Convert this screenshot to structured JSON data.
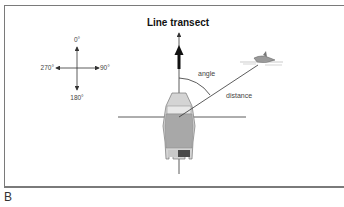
{
  "diagram": {
    "title": "Line transect",
    "panel_label": "B",
    "compass": {
      "north": "0°",
      "east": "90°",
      "south": "180°",
      "west": "270°"
    },
    "labels": {
      "angle": "angle",
      "distance": "distance"
    },
    "icons": {
      "vessel": "boat-icon",
      "target": "dolphin-icon",
      "heading": "arrow-up-icon"
    }
  }
}
